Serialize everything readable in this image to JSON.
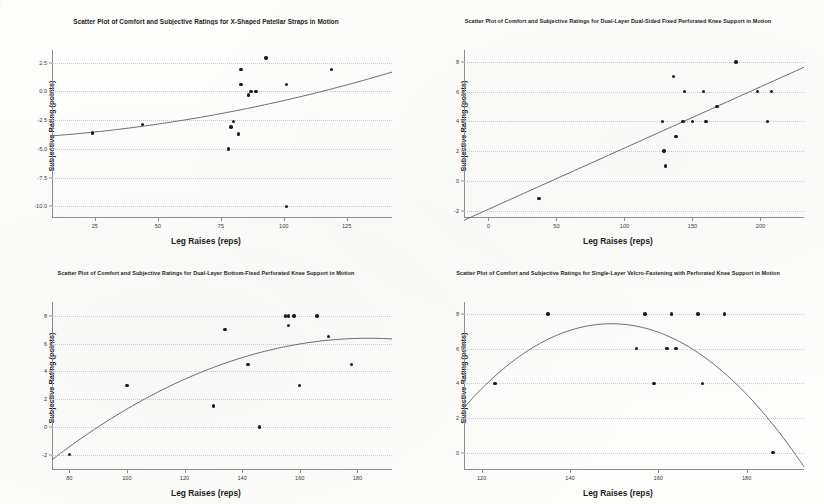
{
  "figure": {
    "layout": "2x2 grid of scatter plots",
    "panel_count": 4
  },
  "common": {
    "xlabel": "Leg Raises (reps)",
    "ylabel": "Subjective Rating (points)"
  },
  "chart_data": [
    {
      "type": "scatter",
      "panel": "top-left",
      "title": "Scatter Plot of Comfort and Subjective Ratings for X-Shaped Patellar Straps in Motion",
      "xlabel": "Leg Raises (reps)",
      "ylabel": "Subjective Rating (points)",
      "xlim": [
        8,
        143
      ],
      "ylim": [
        -11.0,
        3.6
      ],
      "xticks": [
        25,
        50,
        75,
        100,
        125
      ],
      "yticks": [
        2.5,
        0.0,
        -2.5,
        -5.0,
        -7.5,
        -10.0
      ],
      "ytick_labels": [
        "2.5",
        "0.0",
        "-2.5",
        "-5.0",
        "-7.5",
        "-10.0"
      ],
      "grid": true,
      "points": [
        {
          "x": 24,
          "y": -3.6
        },
        {
          "x": 44,
          "y": -2.9
        },
        {
          "x": 78,
          "y": -5.0
        },
        {
          "x": 79,
          "y": -3.1
        },
        {
          "x": 80,
          "y": -2.6
        },
        {
          "x": 82,
          "y": -3.7
        },
        {
          "x": 83,
          "y": 1.9
        },
        {
          "x": 83,
          "y": 0.6
        },
        {
          "x": 86,
          "y": -0.3
        },
        {
          "x": 87,
          "y": 0.0
        },
        {
          "x": 89,
          "y": 0.0
        },
        {
          "x": 93,
          "y": 2.9
        },
        {
          "x": 101,
          "y": 0.6
        },
        {
          "x": 101,
          "y": -10.0
        },
        {
          "x": 119,
          "y": 1.9
        }
      ],
      "fit": {
        "kind": "curve",
        "description": "upward-curving regression line"
      }
    },
    {
      "type": "scatter",
      "panel": "top-right",
      "title": "Scatter Plot of Comfort and Subjective Ratings for Dual-Layer Dual-Sided Fixed Perforated Knee Support in Motion",
      "xlabel": "Leg Raises (reps)",
      "ylabel": "Subjective Rating (points)",
      "xlim": [
        -18,
        232
      ],
      "ylim": [
        -2.5,
        8.8
      ],
      "xticks": [
        0,
        50,
        100,
        150,
        200
      ],
      "yticks": [
        8,
        6,
        4,
        2,
        0,
        -2
      ],
      "ytick_labels": [
        "8",
        "6",
        "4",
        "2",
        "0",
        "-2"
      ],
      "grid": true,
      "points": [
        {
          "x": 37,
          "y": -1.2
        },
        {
          "x": 128,
          "y": 4.0
        },
        {
          "x": 129,
          "y": 2.0
        },
        {
          "x": 130,
          "y": 1.0
        },
        {
          "x": 136,
          "y": 7.0
        },
        {
          "x": 138,
          "y": 3.0
        },
        {
          "x": 143,
          "y": 4.0
        },
        {
          "x": 144,
          "y": 6.0
        },
        {
          "x": 150,
          "y": 4.0
        },
        {
          "x": 158,
          "y": 6.0
        },
        {
          "x": 160,
          "y": 4.0
        },
        {
          "x": 168,
          "y": 5.0
        },
        {
          "x": 182,
          "y": 8.0
        },
        {
          "x": 198,
          "y": 6.0
        },
        {
          "x": 205,
          "y": 4.0
        },
        {
          "x": 208,
          "y": 6.0
        }
      ],
      "fit": {
        "kind": "line",
        "description": "straight positive-slope regression line"
      }
    },
    {
      "type": "scatter",
      "panel": "bottom-left",
      "title": "Scatter Plot of Comfort and Subjective Ratings for Dual-Layer Bottom-Fixed Perforated Knee Support in Motion",
      "xlabel": "Leg Raises (reps)",
      "ylabel": "Subjective Rating (points)",
      "xlim": [
        74,
        192
      ],
      "ylim": [
        -3.1,
        9.0
      ],
      "xticks": [
        80,
        100,
        120,
        140,
        160,
        180
      ],
      "yticks": [
        8,
        6,
        4,
        2,
        0,
        -2
      ],
      "ytick_labels": [
        "8",
        "6",
        "4",
        "2",
        "0",
        "-2"
      ],
      "grid": true,
      "points": [
        {
          "x": 80,
          "y": -2.0
        },
        {
          "x": 100,
          "y": 3.0
        },
        {
          "x": 130,
          "y": 1.5
        },
        {
          "x": 134,
          "y": 7.0
        },
        {
          "x": 142,
          "y": 4.5
        },
        {
          "x": 146,
          "y": 0.0
        },
        {
          "x": 155,
          "y": 8.0
        },
        {
          "x": 156,
          "y": 8.0
        },
        {
          "x": 156,
          "y": 7.3
        },
        {
          "x": 158,
          "y": 8.0
        },
        {
          "x": 160,
          "y": 3.0
        },
        {
          "x": 166,
          "y": 8.0
        },
        {
          "x": 170,
          "y": 6.5
        },
        {
          "x": 178,
          "y": 4.5
        }
      ],
      "fit": {
        "kind": "curve",
        "description": "concave-down saturating regression curve"
      }
    },
    {
      "type": "scatter",
      "panel": "bottom-right",
      "title": "Scatter Plot of Comfort and Subjective Ratings for Single-Layer Velcro-Fastening with Perforated Knee Support in Motion",
      "xlabel": "Leg Raises (reps)",
      "ylabel": "Subjective Rating (points)",
      "xlim": [
        116,
        193
      ],
      "ylim": [
        -1.0,
        8.7
      ],
      "xticks": [
        120,
        140,
        160,
        180
      ],
      "yticks": [
        8,
        6,
        4,
        2,
        0
      ],
      "ytick_labels": [
        "8",
        "6",
        "4",
        "2",
        "0"
      ],
      "grid": true,
      "points": [
        {
          "x": 123,
          "y": 4.0
        },
        {
          "x": 135,
          "y": 8.0
        },
        {
          "x": 155,
          "y": 6.0
        },
        {
          "x": 157,
          "y": 8.0
        },
        {
          "x": 159,
          "y": 4.0
        },
        {
          "x": 162,
          "y": 6.0
        },
        {
          "x": 163,
          "y": 8.0
        },
        {
          "x": 164,
          "y": 6.0
        },
        {
          "x": 169,
          "y": 8.0
        },
        {
          "x": 170,
          "y": 4.0
        },
        {
          "x": 175,
          "y": 8.0
        },
        {
          "x": 186,
          "y": 0.0
        }
      ],
      "fit": {
        "kind": "curve",
        "description": "concave-down parabolic regression curve peaking near x=150"
      }
    }
  ]
}
